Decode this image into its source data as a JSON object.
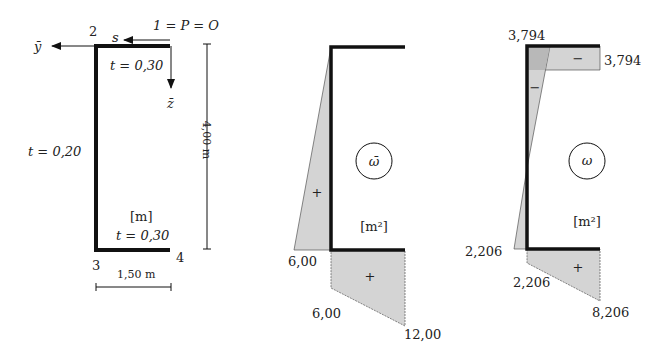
{
  "figure1": {
    "title": "cross-section",
    "labels": {
      "point2": "2",
      "point1": "1 = P = O",
      "point3": "3",
      "point4": "4",
      "axis_y": "ȳ",
      "axis_z": "z̄",
      "axis_s": "s",
      "t_top": "t = 0,30",
      "t_web": "t = 0,20",
      "t_bottom": "t = 0,30",
      "unit": "[m]",
      "height_dim": "4,00 m",
      "width_dim": "1,50 m"
    }
  },
  "figure2": {
    "symbol": "ω̄",
    "unit": "[m²]",
    "values": {
      "web_bottom": "6,00",
      "flange_start": "6,00",
      "flange_end": "12,00"
    },
    "signs": {
      "web": "+",
      "bottom_flange": "+"
    }
  },
  "figure3": {
    "symbol": "ω",
    "unit": "[m²]",
    "values": {
      "top_left": "3,794",
      "top_right": "3,794",
      "web_bottom": "2,206",
      "flange_start": "2,206",
      "flange_end": "8,206"
    },
    "signs": {
      "top_flange": "−",
      "web_top": "−",
      "bottom_flange": "+"
    }
  },
  "colors": {
    "fill": "#d4d4d4",
    "fill_dark": "#b8b8b8",
    "line": "#111111"
  }
}
